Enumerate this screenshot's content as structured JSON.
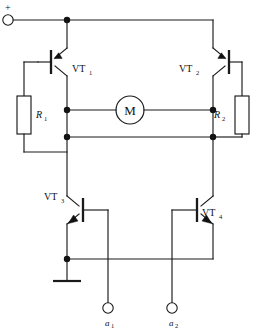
{
  "diagram": {
    "type": "schematic",
    "background_color": "#ffffff",
    "line_color": "#1a1a1a"
  },
  "supply": {
    "polarity_label": "+",
    "terminal_name": "positive-supply-terminal"
  },
  "transistors": {
    "vt1": {
      "label": "VT",
      "subscript": "1",
      "type": "PNP",
      "position": "upper-left"
    },
    "vt2": {
      "label": "VT",
      "subscript": "2",
      "type": "PNP",
      "position": "upper-right"
    },
    "vt3": {
      "label": "VT",
      "subscript": "3",
      "type": "NPN",
      "position": "lower-left"
    },
    "vt4": {
      "label": "VT",
      "subscript": "4",
      "type": "NPN",
      "position": "lower-right"
    }
  },
  "resistors": {
    "r1": {
      "label": "R",
      "subscript": "1",
      "position": "left"
    },
    "r2": {
      "label": "R",
      "subscript": "2",
      "position": "right"
    }
  },
  "motor": {
    "label": "M",
    "name": "dc-motor"
  },
  "input_terminals": [
    {
      "label": "a",
      "subscript": "1",
      "name": "input-terminal-a1"
    },
    {
      "label": "a",
      "subscript": "2",
      "name": "input-terminal-a2"
    }
  ],
  "ground": {
    "name": "ground-symbol",
    "label": ""
  }
}
